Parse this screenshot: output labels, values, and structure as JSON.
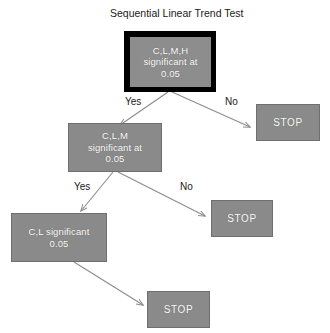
{
  "diagram": {
    "title": "Sequential Linear Trend Test",
    "background_color": "#ffffff",
    "node_fill_color": "#8a8a8a",
    "node_text_color": "#ffffff",
    "root_border_color": "#000000",
    "edge_color": "#8c8c8c",
    "label_text_color": "#1a1a1a"
  },
  "nodes": {
    "root": {
      "id": "clmh-significant",
      "text": "C,L,M,H\nsignificant at\n0.05",
      "kind": "decision",
      "x": 124,
      "y": 31,
      "w": 92,
      "h": 61
    },
    "stop_top_right": {
      "id": "stop-1",
      "text": "STOP",
      "kind": "terminal",
      "x": 256,
      "y": 104,
      "w": 64,
      "h": 37
    },
    "clm": {
      "id": "clm-significant",
      "text": "C,L,M\nsignificant at\n0.05",
      "kind": "decision",
      "x": 68,
      "y": 123,
      "w": 94,
      "h": 49
    },
    "stop_middle": {
      "id": "stop-2",
      "text": "STOP",
      "kind": "terminal",
      "x": 211,
      "y": 200,
      "w": 62,
      "h": 37
    },
    "cl": {
      "id": "cl-significant",
      "text": "C,L significant\n0.05",
      "kind": "decision",
      "x": 11,
      "y": 213,
      "w": 96,
      "h": 49
    },
    "stop_bottom": {
      "id": "stop-3",
      "text": "STOP",
      "kind": "terminal",
      "x": 147,
      "y": 291,
      "w": 63,
      "h": 37
    }
  },
  "branch_labels": [
    {
      "id": "yes-1",
      "text": "Yes",
      "x": 125,
      "y": 96
    },
    {
      "id": "no-1",
      "text": "No",
      "x": 225,
      "y": 96
    },
    {
      "id": "yes-2",
      "text": "Yes",
      "x": 74,
      "y": 181
    },
    {
      "id": "no-2",
      "text": "No",
      "x": 180,
      "y": 181
    }
  ],
  "edges": [
    {
      "id": "root-yes-to-clm",
      "from": "root",
      "to": "clm",
      "label": "Yes"
    },
    {
      "id": "root-no-to-stop1",
      "from": "root",
      "to": "stop_top_right",
      "label": "No"
    },
    {
      "id": "clm-yes-to-cl",
      "from": "clm",
      "to": "cl",
      "label": "Yes"
    },
    {
      "id": "clm-no-to-stop2",
      "from": "clm",
      "to": "stop_middle",
      "label": "No"
    },
    {
      "id": "cl-to-stop3",
      "from": "cl",
      "to": "stop_bottom",
      "label": ""
    }
  ],
  "title_position": {
    "x": 110,
    "y": 7
  }
}
